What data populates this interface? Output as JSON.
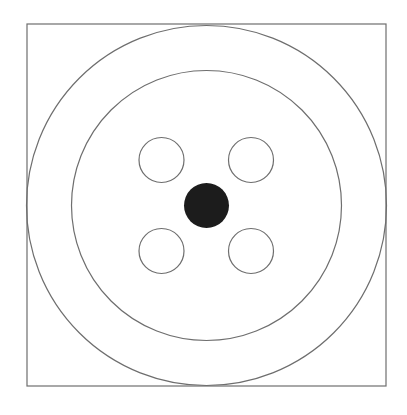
{
  "diagram": {
    "colors": {
      "background": "#ffffff",
      "stroke": "#6e6e6e",
      "fill_dot": "#1c1c1c"
    },
    "frame": {
      "x": 27,
      "y": 24,
      "width": 359,
      "height": 362
    },
    "center": {
      "cx": 206.5,
      "cy": 205.5
    },
    "outer_circle": {
      "r": 180
    },
    "inner_circle": {
      "r": 135
    },
    "center_dot": {
      "r": 22.5
    },
    "small_circles": [
      {
        "name": "top-left",
        "cx": 161.5,
        "cy": 160,
        "r": 22.5
      },
      {
        "name": "top-right",
        "cx": 251,
        "cy": 160,
        "r": 22.5
      },
      {
        "name": "bottom-left",
        "cx": 161.5,
        "cy": 251,
        "r": 22.5
      },
      {
        "name": "bottom-right",
        "cx": 251,
        "cy": 251,
        "r": 22.5
      }
    ]
  }
}
